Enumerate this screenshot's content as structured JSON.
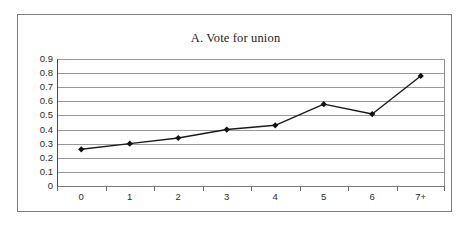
{
  "figure": {
    "title": "A. Vote for union"
  },
  "chart_data": {
    "type": "line",
    "title": "A. Vote for union",
    "xlabel": "",
    "ylabel": "",
    "categories": [
      "0",
      "1",
      "2",
      "3",
      "4",
      "5",
      "6",
      "7+"
    ],
    "values": [
      0.26,
      0.3,
      0.34,
      0.4,
      0.43,
      0.58,
      0.51,
      0.78
    ],
    "series": [
      {
        "name": "Vote for union",
        "values": [
          0.26,
          0.3,
          0.34,
          0.4,
          0.43,
          0.58,
          0.51,
          0.78
        ]
      }
    ],
    "ylim": [
      0,
      0.9
    ],
    "ytick_labels": [
      "0.9",
      "0.8",
      "0.7",
      "0.6",
      "0.5",
      "0.4",
      "0.3",
      "0.2",
      "0.1",
      "0"
    ],
    "ytick_values": [
      0.9,
      0.8,
      0.7,
      0.6,
      0.5,
      0.4,
      0.3,
      0.2,
      0.1,
      0
    ],
    "grid": true,
    "legend": false,
    "legend_position": "none",
    "marker": "diamond",
    "line_color": "#1a1a1a",
    "marker_color": "#111111",
    "gridline_color": "#9a9a9a",
    "background_color": "#ffffff"
  }
}
